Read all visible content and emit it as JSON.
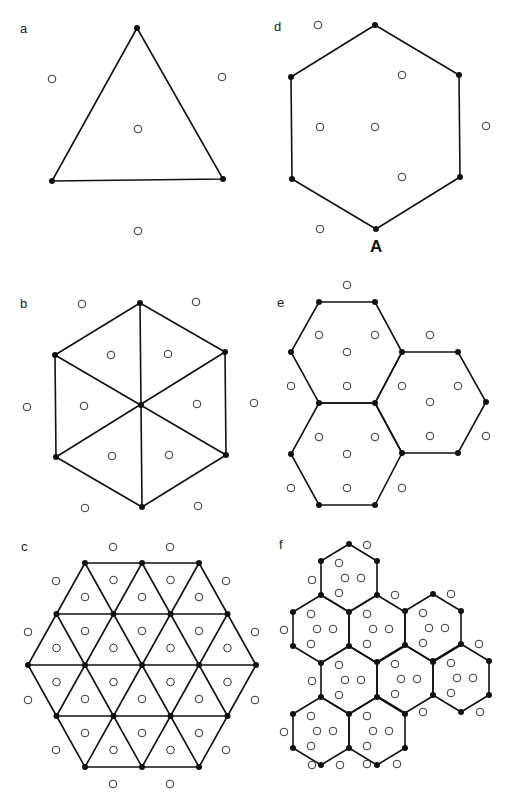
{
  "panels": {
    "a": {
      "label": "a",
      "description": "single triangle with 3 vertices and 4 lattice sites"
    },
    "b": {
      "label": "b",
      "description": "hexagon subdivided into 6 triangles"
    },
    "c": {
      "label": "c",
      "description": "hexagon of 24 triangles"
    },
    "d": {
      "label": "d",
      "description": "single hexagon",
      "vertex_label": "A"
    },
    "e": {
      "label": "e",
      "description": "three joined hexagons"
    },
    "f": {
      "label": "f",
      "description": "cluster of ten hexagons"
    }
  },
  "colors": {
    "line": "#111111",
    "node": "#111111",
    "site_stroke": "#333333",
    "background": "#ffffff"
  }
}
